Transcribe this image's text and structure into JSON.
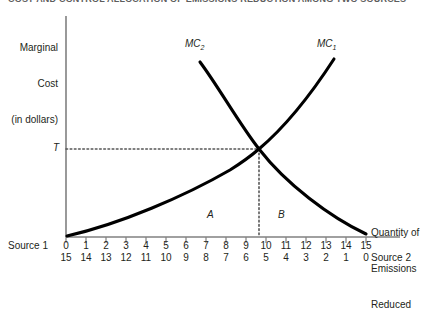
{
  "title": "COST AND CONTROL ALLOCATION OF EMISSIONS REDUCTION AMONG TWO SOURCES",
  "axes": {
    "y_label_lines": [
      "Marginal",
      "Cost",
      "(in dollars)"
    ],
    "y_label": "Marginal Cost (in dollars)",
    "x_label_lines": [
      "Quantity of",
      "Emissions",
      "Reduced"
    ],
    "x_label": "Quantity of Emissions Reduced",
    "source1_label": "Source 1",
    "source2_label": "Source 2"
  },
  "annotations": {
    "equilibrium_price": "T",
    "region_a": "A",
    "region_b": "B",
    "curve1_label": "MC",
    "curve1_sub": "1",
    "curve2_label": "MC",
    "curve2_sub": "2"
  },
  "colors": {
    "curve": "#000000",
    "axis": "#808080",
    "text": "#231f20",
    "dotted": "#555555"
  },
  "chart_data": {
    "type": "line",
    "title": "COST AND CONTROL ALLOCATION OF EMISSIONS REDUCTION AMONG TWO SOURCES",
    "xlabel": "Quantity of Emissions Reduced",
    "ylabel": "Marginal Cost (in dollars)",
    "grid": false,
    "legend": "inline-curve-labels",
    "xlim": [
      0,
      15
    ],
    "ylim": [
      0,
      10
    ],
    "source1_ticks": [
      0,
      1,
      2,
      3,
      4,
      5,
      6,
      7,
      8,
      9,
      10,
      11,
      12,
      13,
      14,
      15
    ],
    "source2_ticks": [
      15,
      14,
      13,
      12,
      11,
      10,
      9,
      8,
      7,
      6,
      5,
      4,
      3,
      2,
      1,
      0
    ],
    "equilibrium": {
      "x_source1": 10,
      "x_source2": 5,
      "price_label": "T",
      "price_value": 4.0
    },
    "regions": [
      {
        "name": "A",
        "description": "abatement cost area for Source 1",
        "x_range": [
          0,
          10
        ]
      },
      {
        "name": "B",
        "description": "abatement cost area for Source 2",
        "x_range": [
          10,
          15
        ]
      }
    ],
    "series": [
      {
        "name": "MC1",
        "label": "MC₁",
        "description": "Marginal cost of Source 1, increasing convex from origin",
        "x": [
          0,
          2,
          4,
          6,
          8,
          10,
          12,
          14,
          15
        ],
        "y": [
          0.1,
          1.0,
          1.85,
          2.7,
          3.3,
          4.0,
          5.5,
          7.3,
          8.2
        ]
      },
      {
        "name": "MC2",
        "label": "MC₂",
        "description": "Marginal cost of Source 2, decreasing from left measured right-to-left",
        "x": [
          6.7,
          8,
          10,
          12,
          14,
          15
        ],
        "y": [
          8.0,
          6.4,
          4.0,
          2.4,
          0.9,
          0.2
        ]
      }
    ]
  }
}
